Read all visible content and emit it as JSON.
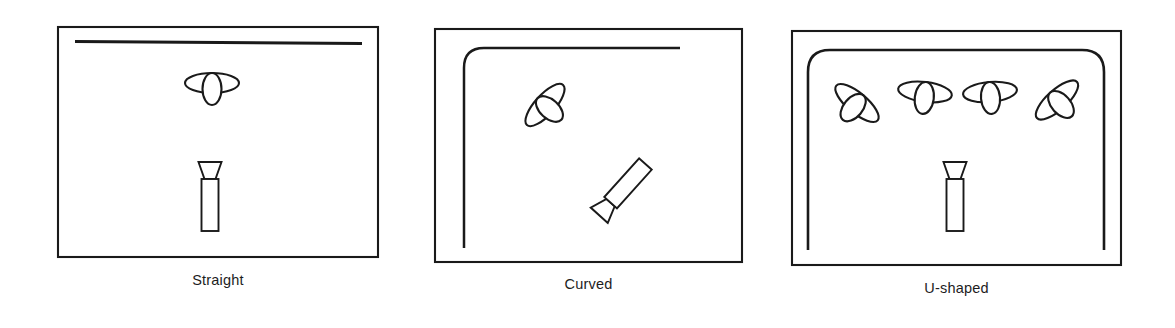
{
  "figure": {
    "kind": "line-drawing-diagram",
    "background_color": "#ffffff",
    "ink_color": "#1a1a1a",
    "panel_count": 3
  },
  "panels": [
    {
      "id": "straight",
      "caption": "Straight",
      "frame": {
        "x": 58,
        "y": 27,
        "width": 320,
        "height": 230,
        "corner_radius": 0
      },
      "path": {
        "name": "straight-path",
        "shape": "horizontal-line",
        "x1": 75,
        "y1": 41,
        "x2": 362,
        "y2": 43
      },
      "objects": [
        {
          "name": "aircraft",
          "x": 212,
          "y": 83,
          "rotation": 0
        },
        {
          "name": "observer",
          "x": 210,
          "y": 196,
          "rotation": 0
        }
      ]
    },
    {
      "id": "curved",
      "caption": "Curved",
      "frame": {
        "x": 435,
        "y": 29,
        "width": 307,
        "height": 233,
        "corner_radius": 0
      },
      "path": {
        "name": "curved-path",
        "shape": "rounded-corner-line",
        "corner_radius": 20,
        "vertical_x": 464,
        "vertical_bottom_y": 248,
        "horizontal_y": 48,
        "horizontal_end_x": 680
      },
      "objects": [
        {
          "name": "aircraft",
          "x": 545,
          "y": 105,
          "rotation": -48
        },
        {
          "name": "observer",
          "x": 622,
          "y": 190,
          "rotation": -138
        }
      ]
    },
    {
      "id": "ushaped",
      "caption": "U-shaped",
      "frame": {
        "x": 792,
        "y": 31,
        "width": 329,
        "height": 234,
        "corner_radius": 0
      },
      "path": {
        "name": "ushaped-path",
        "shape": "inverted-u",
        "corner_radius": 22,
        "left_x": 808,
        "right_x": 1104,
        "top_y": 50,
        "left_bottom_y": 250,
        "right_bottom_y": 250
      },
      "objects": [
        {
          "name": "aircraft",
          "x": 857,
          "y": 103,
          "rotation": 40
        },
        {
          "name": "aircraft",
          "x": 925,
          "y": 92,
          "rotation": 7
        },
        {
          "name": "aircraft",
          "x": 990,
          "y": 92,
          "rotation": -5
        },
        {
          "name": "aircraft",
          "x": 1057,
          "y": 100,
          "rotation": -42
        },
        {
          "name": "observer",
          "x": 955,
          "y": 196,
          "rotation": 0
        }
      ]
    }
  ],
  "glyphs": {
    "aircraft": {
      "description": "stylized bird or aircraft: elongated horizontal ellipse (wings) crossed by a smaller vertical ellipse (body)",
      "wing_rx": 27,
      "wing_ry": 10,
      "body_rx": 9.5,
      "body_ry": 16
    },
    "observer": {
      "description": "observer figure: inverted trapezoid viewing cone above an upright rectangular body",
      "cone_top_width": 23,
      "cone_bottom_width": 11,
      "cone_height": 17,
      "body_width": 17,
      "body_height": 52
    }
  },
  "captions": {
    "straight": "Straight",
    "curved": "Curved",
    "ushaped": "U-shaped"
  }
}
